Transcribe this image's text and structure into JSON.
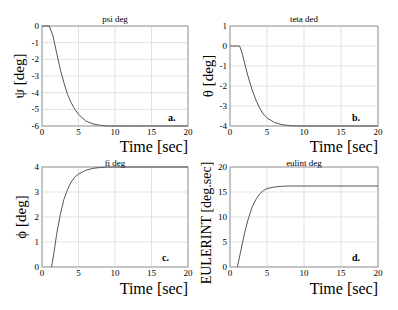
{
  "figure": {
    "background": "#ffffff",
    "grid_color": "#d9d9d9",
    "axis_color": "#999999",
    "line_color": "#555555"
  },
  "chart_data": [
    {
      "type": "line",
      "panel_label": "a.",
      "title": "psi deg",
      "xlabel": "Time [sec]",
      "ylabel": "ψ [deg]",
      "xlim": [
        0,
        20
      ],
      "ylim": [
        -6,
        0
      ],
      "xticks": [
        "0",
        "5",
        "10",
        "15",
        "20"
      ],
      "yticks": [
        "0",
        "-1",
        "-2",
        "-3",
        "-4",
        "-5",
        "-6"
      ],
      "grid": true,
      "x": [
        0,
        1,
        1.5,
        2,
        2.5,
        3,
        3.5,
        4,
        4.5,
        5,
        6,
        7,
        8,
        9,
        10,
        12,
        15,
        20
      ],
      "y": [
        0,
        0,
        -0.6,
        -1.6,
        -2.6,
        -3.4,
        -4.1,
        -4.6,
        -5.0,
        -5.3,
        -5.7,
        -5.88,
        -5.96,
        -6.0,
        -6.0,
        -6.0,
        -6.0,
        -6.0
      ]
    },
    {
      "type": "line",
      "panel_label": "b.",
      "title": "teta ded",
      "xlabel": "Time [sec]",
      "ylabel": "θ [deg]",
      "xlim": [
        0,
        20
      ],
      "ylim": [
        -4,
        1
      ],
      "xticks": [
        "0",
        "5",
        "10",
        "15",
        "20"
      ],
      "yticks": [
        "1",
        "0",
        "-1",
        "-2",
        "-3",
        "-4"
      ],
      "grid": true,
      "x": [
        0,
        1.3,
        1.6,
        2,
        2.5,
        3,
        3.5,
        4,
        4.5,
        5,
        6,
        7,
        8,
        9,
        10,
        12,
        15,
        20
      ],
      "y": [
        0,
        0,
        -0.3,
        -0.9,
        -1.6,
        -2.2,
        -2.7,
        -3.1,
        -3.4,
        -3.6,
        -3.82,
        -3.93,
        -3.98,
        -4.0,
        -4.0,
        -4.0,
        -4.0,
        -4.0
      ]
    },
    {
      "type": "line",
      "panel_label": "c.",
      "title": "fi deg",
      "xlabel": "Time [sec]",
      "ylabel": "ϕ [deg]",
      "xlim": [
        0,
        20
      ],
      "ylim": [
        0,
        4
      ],
      "xticks": [
        "0",
        "5",
        "10",
        "15",
        "20"
      ],
      "yticks": [
        "4",
        "3",
        "2",
        "1",
        "0"
      ],
      "grid": true,
      "x": [
        1.3,
        1.6,
        2,
        2.5,
        3,
        3.5,
        4,
        4.5,
        5,
        6,
        7,
        8,
        9,
        10,
        12,
        15,
        20
      ],
      "y": [
        0,
        0.5,
        1.3,
        2.1,
        2.7,
        3.1,
        3.4,
        3.6,
        3.72,
        3.87,
        3.95,
        3.98,
        4.0,
        4.0,
        4.0,
        4.0,
        4.0
      ]
    },
    {
      "type": "line",
      "panel_label": "d.",
      "title": "eulint deg",
      "xlabel": "Time [sec]",
      "ylabel": "EULERINT [deg.sec]",
      "xlim": [
        0,
        20
      ],
      "ylim": [
        0,
        20
      ],
      "xticks": [
        "0",
        "5",
        "10",
        "15",
        "20"
      ],
      "yticks": [
        "20",
        "15",
        "10",
        "5",
        "0"
      ],
      "grid": true,
      "x": [
        1.0,
        1.5,
        2,
        2.5,
        3,
        3.5,
        4,
        4.5,
        5,
        6,
        7,
        8,
        10,
        12,
        15,
        20
      ],
      "y": [
        0,
        3.5,
        7.0,
        9.8,
        12.0,
        13.5,
        14.6,
        15.3,
        15.7,
        16.0,
        16.15,
        16.2,
        16.2,
        16.2,
        16.2,
        16.2
      ]
    }
  ]
}
